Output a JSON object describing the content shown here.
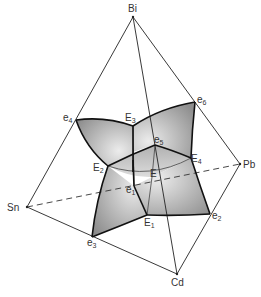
{
  "diagram": {
    "type": "quaternary phase diagram (tetrahedron)",
    "components": {
      "apex_top": "Bi",
      "left": "Sn",
      "right": "Pb",
      "bottom": "Cd"
    },
    "binary_eutectics": {
      "e1": {
        "main": "e",
        "sub": "1"
      },
      "e2": {
        "main": "e",
        "sub": "2"
      },
      "e3": {
        "main": "e",
        "sub": "3"
      },
      "e4": {
        "main": "e",
        "sub": "4"
      },
      "e5": {
        "main": "e",
        "sub": "5"
      },
      "e6": {
        "main": "e",
        "sub": "6"
      }
    },
    "ternary_eutectics": {
      "E1": {
        "main": "E",
        "sub": "1"
      },
      "E2": {
        "main": "E",
        "sub": "2"
      },
      "E3": {
        "main": "E",
        "sub": "3"
      },
      "E4": {
        "main": "E",
        "sub": "4"
      }
    },
    "quaternary_eutectic": "E",
    "colors": {
      "line": "#222222",
      "surface_dark": "#8a8a8a",
      "surface_light": "#e6e6e6",
      "background": "#ffffff"
    }
  }
}
